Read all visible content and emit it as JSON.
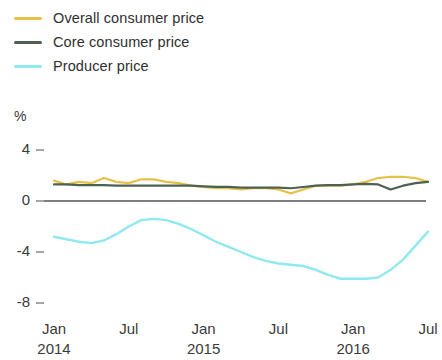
{
  "legend": {
    "items": [
      {
        "label": "Overall consumer price",
        "color": "#e8c14a",
        "key": "overall_consumer_price"
      },
      {
        "label": "Core consumer price",
        "color": "#4d6152",
        "key": "core_consumer_price"
      },
      {
        "label": "Producer price",
        "color": "#8fe9ee",
        "key": "producer_price"
      }
    ]
  },
  "axes": {
    "unit": "%",
    "y_ticks": [
      "4",
      "0",
      "-4",
      "-8"
    ],
    "x_months": [
      "Jan",
      "Jul",
      "Jan",
      "Jul",
      "Jan",
      "Jul"
    ],
    "x_years": [
      "2014",
      "",
      "2015",
      "",
      "2016",
      ""
    ]
  },
  "chart_data": {
    "type": "line",
    "title": "",
    "xlabel": "",
    "ylabel": "%",
    "ylim": [
      -8,
      4
    ],
    "yticks": [
      4,
      0,
      -4,
      -8
    ],
    "grid": false,
    "zero_line": true,
    "legend_position": "top-left",
    "x": [
      "2014-01",
      "2014-02",
      "2014-03",
      "2014-04",
      "2014-05",
      "2014-06",
      "2014-07",
      "2014-08",
      "2014-09",
      "2014-10",
      "2014-11",
      "2014-12",
      "2015-01",
      "2015-02",
      "2015-03",
      "2015-04",
      "2015-05",
      "2015-06",
      "2015-07",
      "2015-08",
      "2015-09",
      "2015-10",
      "2015-11",
      "2015-12",
      "2016-01",
      "2016-02",
      "2016-03",
      "2016-04",
      "2016-05",
      "2016-06",
      "2016-07"
    ],
    "x_tick_labels": [
      "Jan 2014",
      "Jul",
      "Jan 2015",
      "Jul",
      "Jan 2016",
      "Jul"
    ],
    "series": [
      {
        "name": "Overall consumer price",
        "color": "#e8c14a",
        "values": [
          1.6,
          1.3,
          1.5,
          1.4,
          1.8,
          1.5,
          1.4,
          1.7,
          1.7,
          1.5,
          1.4,
          1.2,
          1.1,
          1.0,
          1.0,
          0.9,
          1.0,
          1.0,
          0.9,
          0.6,
          0.9,
          1.2,
          1.2,
          1.2,
          1.3,
          1.5,
          1.8,
          1.9,
          1.9,
          1.8,
          1.5
        ]
      },
      {
        "name": "Core consumer price",
        "color": "#4d6152",
        "values": [
          1.3,
          1.3,
          1.25,
          1.25,
          1.25,
          1.2,
          1.2,
          1.2,
          1.2,
          1.2,
          1.2,
          1.2,
          1.15,
          1.1,
          1.1,
          1.05,
          1.05,
          1.05,
          1.05,
          1.0,
          1.1,
          1.2,
          1.25,
          1.25,
          1.3,
          1.35,
          1.3,
          0.9,
          1.2,
          1.4,
          1.5
        ]
      },
      {
        "name": "Producer price",
        "color": "#8fe9ee",
        "values": [
          -2.8,
          -3.0,
          -3.2,
          -3.3,
          -3.1,
          -2.6,
          -2.0,
          -1.5,
          -1.4,
          -1.5,
          -1.8,
          -2.2,
          -2.7,
          -3.2,
          -3.6,
          -4.0,
          -4.4,
          -4.7,
          -4.9,
          -5.0,
          -5.1,
          -5.4,
          -5.8,
          -6.1,
          -6.1,
          -6.1,
          -6.0,
          -5.4,
          -4.6,
          -3.5,
          -2.4
        ]
      }
    ]
  }
}
